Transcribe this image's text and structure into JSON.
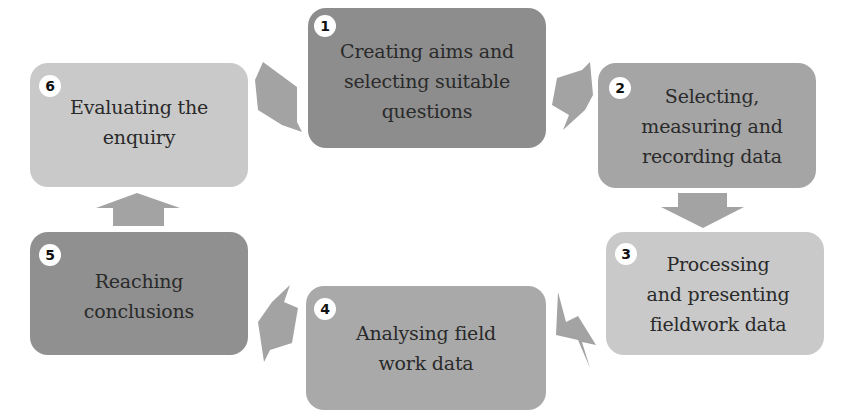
{
  "diagram": {
    "type": "cycle",
    "title": "",
    "colors": {
      "dark": "#8c8c8c",
      "medium": "#a7a7a7",
      "light": "#c9c9c9",
      "arrow": "#a3a3a3",
      "badge_bg": "#ffffff"
    },
    "steps": [
      {
        "number": "1",
        "label": "Creating aims and\nselecting suitable\nquestions"
      },
      {
        "number": "2",
        "label": "Selecting,\nmeasuring and\nrecording data"
      },
      {
        "number": "3",
        "label": "Processing\nand presenting\nfieldwork data"
      },
      {
        "number": "4",
        "label": "Analysing field\nwork data"
      },
      {
        "number": "5",
        "label": "Reaching\nconclusions"
      },
      {
        "number": "6",
        "label": "Evaluating the\nenquiry"
      }
    ],
    "arrows": [
      {
        "from": "1",
        "to": "2",
        "direction": "down-right"
      },
      {
        "from": "2",
        "to": "3",
        "direction": "down"
      },
      {
        "from": "3",
        "to": "4",
        "direction": "down-left"
      },
      {
        "from": "4",
        "to": "5",
        "direction": "up-left"
      },
      {
        "from": "5",
        "to": "6",
        "direction": "up"
      },
      {
        "from": "6",
        "to": "1",
        "direction": "up-right"
      }
    ]
  }
}
